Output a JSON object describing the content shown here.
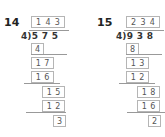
{
  "problems": [
    {
      "number": "14",
      "divisor": "4",
      "dividend": [
        "5",
        "7",
        "5"
      ],
      "quotient": [
        "1",
        "4",
        "3"
      ],
      "steps": [
        {
          "digits": [
            "4"
          ]
        },
        {
          "digits": [
            "1",
            "7"
          ]
        },
        {
          "digits": [
            "1",
            "6"
          ]
        },
        {
          "digits": [
            "1",
            "5"
          ]
        },
        {
          "digits": [
            "1",
            "2"
          ]
        },
        {
          "digits": [
            "3"
          ]
        }
      ]
    },
    {
      "number": "15",
      "divisor": "4",
      "dividend": [
        "9",
        "3",
        "8"
      ],
      "quotient": [
        "2",
        "3",
        "4"
      ],
      "steps": [
        {
          "digits": [
            "8"
          ]
        },
        {
          "digits": [
            "1",
            "3"
          ]
        },
        {
          "digits": [
            "1",
            "2"
          ]
        },
        {
          "digits": [
            "1",
            "8"
          ]
        },
        {
          "digits": [
            "1",
            "6"
          ]
        },
        {
          "digits": [
            "2"
          ]
        }
      ]
    }
  ]
}
